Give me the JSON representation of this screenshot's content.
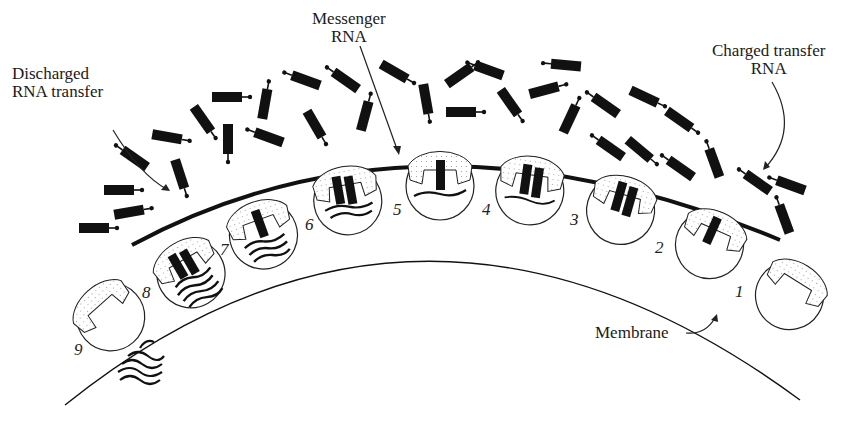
{
  "diagram": {
    "type": "protein-synthesis-polysome",
    "colors": {
      "ink": "#111111",
      "background": "#ffffff",
      "stipple": "#bbbbbb"
    },
    "labels": {
      "messenger_rna": {
        "line1": "Messenger",
        "line2": "RNA"
      },
      "discharged_rna": {
        "line1": "Discharged",
        "line2": "RNA transfer"
      },
      "charged_trna": {
        "line1": "Charged transfer",
        "line2": "RNA"
      },
      "membrane": "Membrane"
    },
    "ribosomes": [
      {
        "number": "1",
        "letters": [
          "d",
          "c",
          "e"
        ]
      },
      {
        "number": "2"
      },
      {
        "number": "3",
        "fragment": "AOΠ"
      },
      {
        "number": "4"
      },
      {
        "number": "5"
      },
      {
        "number": "6"
      },
      {
        "number": "7"
      },
      {
        "number": "8"
      },
      {
        "number": "9",
        "letters": [
          "d",
          "c",
          "e"
        ]
      }
    ]
  }
}
